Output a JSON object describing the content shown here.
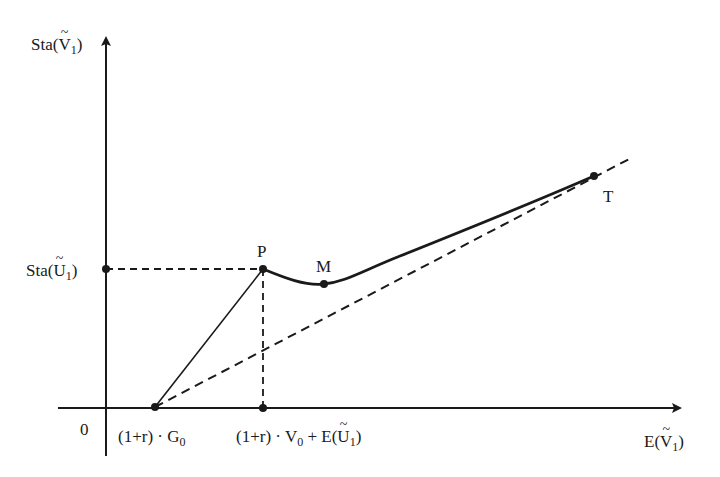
{
  "diagram": {
    "type": "economic-graph",
    "y_axis": {
      "label_prefix": "Sta(",
      "label_var": "V",
      "label_sub": "1",
      "label_suffix": ")"
    },
    "x_axis": {
      "label_prefix": "E(",
      "label_var": "V",
      "label_sub": "1",
      "label_suffix": ")"
    },
    "origin_label": "0",
    "y_tick": {
      "label_prefix": "Sta(",
      "label_var": "U",
      "label_sub": "1",
      "label_suffix": ")"
    },
    "x_ticks": [
      {
        "label_pre": "(1+r) · G",
        "label_sub": "0",
        "label_post": ""
      },
      {
        "label_pre": "(1+r) · V",
        "label_sub": "0",
        "label_post": " + E(",
        "label_var": "U",
        "label_sub2": "1",
        "label_end": ")"
      }
    ],
    "points": [
      {
        "name": "P",
        "label": "P"
      },
      {
        "name": "M",
        "label": "M"
      },
      {
        "name": "T",
        "label": "T"
      }
    ],
    "colors": {
      "line": "#1a1a1a",
      "background": "#ffffff"
    }
  }
}
